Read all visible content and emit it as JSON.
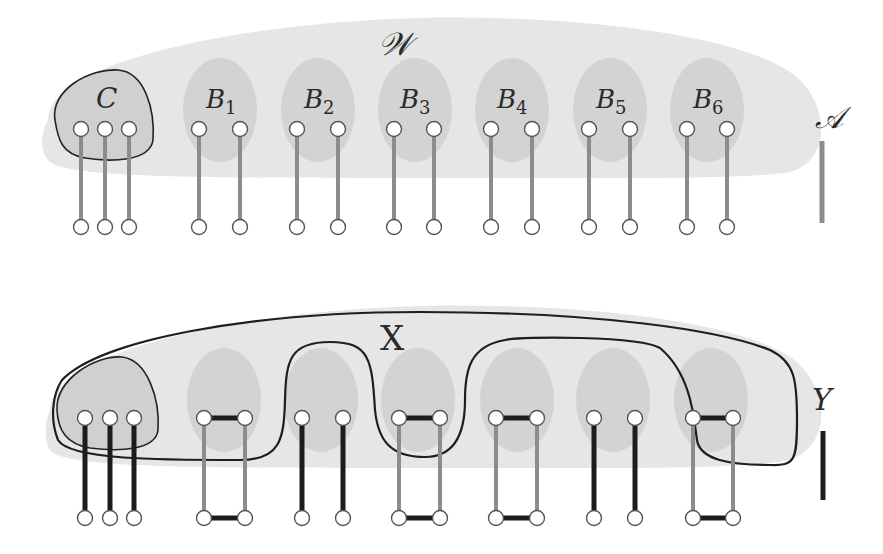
{
  "top_panel": {
    "outer_set_label": "𝒲",
    "cluster_label": "C",
    "blobs": [
      {
        "label": "B",
        "sub": "1"
      },
      {
        "label": "B",
        "sub": "2"
      },
      {
        "label": "B",
        "sub": "3"
      },
      {
        "label": "B",
        "sub": "4"
      },
      {
        "label": "B",
        "sub": "5"
      },
      {
        "label": "B",
        "sub": "6"
      }
    ],
    "legend_label": "𝒜",
    "legend_color": "#8a8a8a"
  },
  "bottom_panel": {
    "contour_label": "X",
    "legend_label": "Υ",
    "legend_color": "#1a1a1a"
  },
  "colors": {
    "outer_fill": "#e6e6e6",
    "blob_fill": "#d2d2d2",
    "gray_edge": "#8c8c8c",
    "black_edge": "#1c1c1c",
    "contour": "#1e1e1e",
    "node_fill": "#ffffff",
    "node_stroke": "#555555"
  }
}
